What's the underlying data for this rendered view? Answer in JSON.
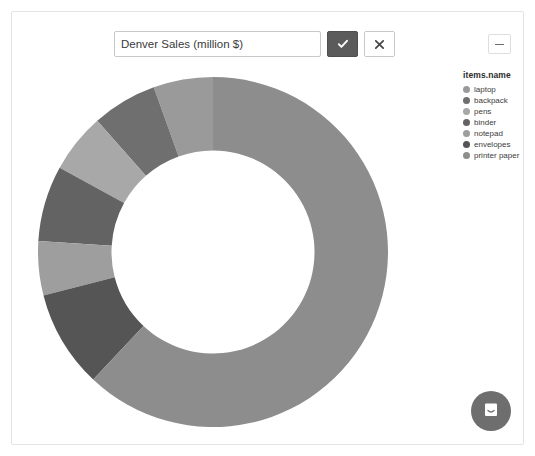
{
  "window": {
    "minimize_label": "—"
  },
  "title_editor": {
    "value": "Denver Sales (million $)",
    "placeholder": "Chart title",
    "confirm_label": "✔",
    "cancel_label": "✖",
    "confirm_icon": "check-icon",
    "cancel_icon": "close-icon"
  },
  "legend": {
    "title": "items.name",
    "items": [
      {
        "label": "laptop",
        "color": "#9a9a9a"
      },
      {
        "label": "backpack",
        "color": "#6f6f6f"
      },
      {
        "label": "pens",
        "color": "#a8a8a8"
      },
      {
        "label": "binder",
        "color": "#636363"
      },
      {
        "label": "notepad",
        "color": "#9e9e9e"
      },
      {
        "label": "envelopes",
        "color": "#555555"
      },
      {
        "label": "printer paper",
        "color": "#8d8d8d"
      }
    ]
  },
  "chat": {
    "icon": "chat-bubble-icon",
    "button_color": "#6e6e6e"
  },
  "chart_data": {
    "type": "pie",
    "variant": "donut",
    "legend_title": "items.name",
    "legend_position": "right",
    "categories": [
      "laptop",
      "backpack",
      "pens",
      "binder",
      "notepad",
      "envelopes",
      "printer paper"
    ],
    "values": [
      5.5,
      6.0,
      5.5,
      7.0,
      5.0,
      9.0,
      62.0
    ],
    "unit": "million $",
    "colors": [
      "#9a9a9a",
      "#6f6f6f",
      "#a8a8a8",
      "#636363",
      "#9e9e9e",
      "#555555",
      "#8d8d8d"
    ],
    "start_angle": -90,
    "direction": "counterclockwise",
    "inner_radius_ratio": 0.58,
    "xlabel": "",
    "ylabel": ""
  }
}
